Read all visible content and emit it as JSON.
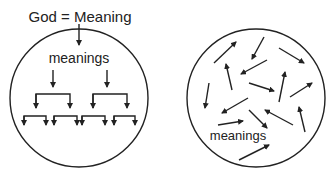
{
  "left_panel": {
    "title": "God = Meaning",
    "label": "meanings"
  },
  "right_panel": {
    "label": "meanings"
  },
  "colors": {
    "stroke": "#222222",
    "background": "#ffffff"
  }
}
